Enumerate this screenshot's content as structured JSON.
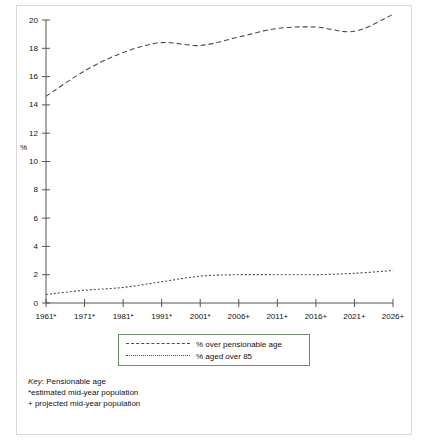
{
  "chart_data": {
    "type": "line",
    "title": "",
    "xlabel": "",
    "ylabel": "%",
    "xlim_labels": [
      "1961*",
      "1971*",
      "1981*",
      "1991*",
      "2001*",
      "2006+",
      "2011+",
      "2016+",
      "2021+",
      "2026+"
    ],
    "x": [
      "1961*",
      "1971*",
      "1981*",
      "1991*",
      "2001*",
      "2006+",
      "2011+",
      "2016+",
      "2021+",
      "2026+"
    ],
    "ylim": [
      0,
      20
    ],
    "yticks": [
      0,
      2,
      4,
      6,
      8,
      10,
      12,
      14,
      16,
      18,
      20
    ],
    "ytick_labels": [
      "0",
      "2",
      "4",
      "6",
      "8",
      "10",
      "12",
      "14",
      "16",
      "18",
      "20"
    ],
    "grid": false,
    "legend_position": "below-plot",
    "series": [
      {
        "name": "% over pensionable age",
        "style": "dashed",
        "values": [
          14.6,
          16.4,
          17.7,
          18.4,
          18.2,
          18.8,
          19.4,
          19.5,
          19.2,
          20.4
        ]
      },
      {
        "name": "% aged over 85",
        "style": "dotted",
        "values": [
          0.6,
          0.9,
          1.1,
          1.5,
          1.9,
          2.0,
          2.0,
          2.0,
          2.1,
          2.3
        ]
      }
    ]
  },
  "axes": {
    "y_axis_unit_label": "%",
    "y_tick_labels": [
      "20",
      "18",
      "16",
      "14",
      "12",
      "10",
      "8",
      "6",
      "4",
      "2",
      "0"
    ],
    "x_tick_labels": [
      "1961*",
      "1971*",
      "1981*",
      "1991*",
      "2001*",
      "2006+",
      "2011+",
      "2016+",
      "2021+",
      "2026+"
    ]
  },
  "legend": {
    "items": [
      {
        "label": "% over pensionable age",
        "style": "dashed"
      },
      {
        "label": "% aged over 85",
        "style": "dotted"
      }
    ]
  },
  "footer": {
    "key_word": "Key",
    "key_line": ": Pensionable age",
    "note_estimated": "*estimated mid-year population",
    "note_projected": "+ projected mid-year population"
  },
  "colors": {
    "line": "#4a4a4a",
    "axis": "#555555",
    "legend_border": "#6e8f6e",
    "card_border": "#d8d8d8",
    "text": "#111111",
    "background": "#ffffff"
  }
}
